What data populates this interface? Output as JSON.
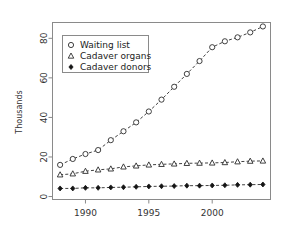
{
  "chart_data": {
    "type": "line",
    "title": "",
    "xlabel": "",
    "ylabel": "Thousands",
    "xlim": [
      1987.4,
      2004.6
    ],
    "ylim": [
      -1.5,
      88
    ],
    "grid": false,
    "legend_position": "top-left",
    "x": [
      1988,
      1989,
      1990,
      1991,
      1992,
      1993,
      1994,
      1995,
      1996,
      1997,
      1998,
      1999,
      2000,
      2001,
      2002,
      2003,
      2004
    ],
    "xticks": [
      1990,
      1995,
      2000
    ],
    "xticklabels": [
      "1990",
      "1995",
      "2000"
    ],
    "yticks": [
      0,
      20,
      40,
      60,
      80
    ],
    "yticklabels": [
      "0",
      "20",
      "40",
      "60",
      "80"
    ],
    "series": [
      {
        "name": "Waiting list",
        "marker": "open-circle",
        "linestyle": "dashed",
        "values": [
          16.0,
          19.0,
          21.5,
          23.5,
          28.5,
          33.0,
          37.5,
          43.0,
          49.0,
          55.5,
          62.0,
          68.5,
          75.5,
          78.5,
          80.5,
          83.0,
          86.0
        ]
      },
      {
        "name": "Cadaver organs",
        "marker": "open-triangle",
        "linestyle": "dashed",
        "values": [
          11.0,
          11.5,
          12.8,
          13.5,
          14.0,
          15.0,
          15.5,
          16.0,
          16.3,
          16.5,
          16.8,
          16.9,
          17.0,
          17.2,
          17.6,
          17.9,
          18.0
        ]
      },
      {
        "name": "Cadaver donors",
        "marker": "solid-diamond",
        "linestyle": "dashed",
        "values": [
          4.1,
          4.1,
          4.4,
          4.4,
          4.6,
          4.7,
          4.9,
          5.1,
          5.2,
          5.3,
          5.5,
          5.5,
          5.6,
          5.7,
          5.9,
          6.0,
          6.1
        ]
      }
    ]
  },
  "legend": {
    "entries": [
      {
        "label": "Waiting list",
        "marker": "open-circle"
      },
      {
        "label": "Cadaver organs",
        "marker": "open-triangle"
      },
      {
        "label": "Cadaver donors",
        "marker": "solid-diamond"
      }
    ]
  },
  "colors": {
    "background": "#ffffff",
    "axis": "#8a8a8a",
    "ink": "#2b2b2b",
    "marker_fill": "#ffffff",
    "solid_marker": "#141414"
  }
}
